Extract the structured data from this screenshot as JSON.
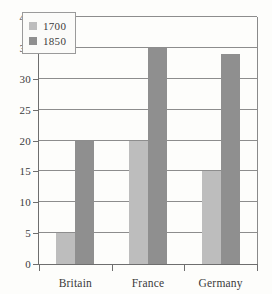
{
  "chart_data": {
    "type": "bar",
    "title": "",
    "subtitle": "",
    "xlabel": "",
    "ylabel": "",
    "categories": [
      "Britain",
      "France",
      "Germany"
    ],
    "series": [
      {
        "name": "1700",
        "values": [
          5,
          20,
          15
        ],
        "color": "#bdbdbd"
      },
      {
        "name": "1850",
        "values": [
          20,
          35,
          34
        ],
        "color": "#8f8f8f"
      }
    ],
    "ylim": [
      0,
      40
    ],
    "ytick_step": 5,
    "yticks": [
      0,
      5,
      10,
      15,
      20,
      25,
      30,
      35,
      40
    ],
    "ytick_labels": [
      "0",
      "5",
      "10",
      "15",
      "20",
      "25",
      "30",
      "35",
      "40"
    ],
    "grid": true,
    "grid_axis": "y",
    "legend_position": "top-left-inside",
    "legend_entries": [
      "1700",
      "1850"
    ],
    "annotations": []
  },
  "style": {
    "background": "#fdfdfb",
    "axis_color": "#6e6e6e",
    "grid_color": "#8d8d8d",
    "text_color": "#3b3b3b",
    "legend_border": "#9a9a9a",
    "legend_background": "#fbfbf9"
  }
}
